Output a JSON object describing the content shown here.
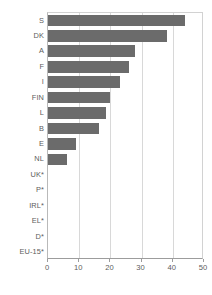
{
  "chart_data": {
    "type": "bar",
    "orientation": "horizontal",
    "title": "",
    "subtitle": "",
    "xlabel": "",
    "ylabel": "",
    "xlim": [
      0,
      50
    ],
    "ylim": null,
    "grid": true,
    "legend": null,
    "legend_position": "none",
    "bar_color": "#6b6b6b",
    "xticks": [
      0,
      10,
      20,
      30,
      40,
      50
    ],
    "xtick_labels": [
      "0",
      "10",
      "20",
      "30",
      "40",
      "50"
    ],
    "categories": [
      "S",
      "DK",
      "A",
      "F",
      "I",
      "FIN",
      "L",
      "B",
      "E",
      "NL",
      "UK*",
      "P*",
      "IRL*",
      "EL*",
      "D*",
      "EU-15*"
    ],
    "values": [
      44,
      38,
      28,
      26,
      23,
      20,
      18.5,
      16.5,
      9,
      6,
      0,
      0,
      0,
      0,
      0,
      0
    ],
    "annotations": [
      "Categories marked with * have no data value shown (zero-length bars)."
    ]
  }
}
